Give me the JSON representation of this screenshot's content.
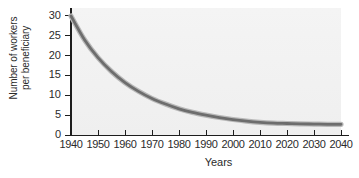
{
  "chart_data": {
    "type": "line",
    "title": "",
    "xlabel": "Years",
    "ylabel": "Number of workers per beneficiary",
    "ylabel_lines": [
      "Number of workers",
      "per beneficiary"
    ],
    "xlim": [
      1940,
      2040
    ],
    "ylim": [
      0,
      32
    ],
    "grid": false,
    "legend": "none",
    "xticks": [
      1940,
      1950,
      1960,
      1970,
      1980,
      1990,
      2000,
      2010,
      2020,
      2030,
      2040
    ],
    "xtick_labels": [
      "1940",
      "1950",
      "1960",
      "1970",
      "1980",
      "1990",
      "2000",
      "2010",
      "2020",
      "2030",
      "2040"
    ],
    "yticks": [
      0,
      5,
      10,
      15,
      20,
      25,
      30
    ],
    "ytick_labels": [
      "0",
      "5",
      "10",
      "15",
      "20",
      "25",
      "30"
    ],
    "series": [
      {
        "name": "Workers per beneficiary",
        "color": "#6d6d6d",
        "x": [
          1940,
          1945,
          1950,
          1955,
          1960,
          1965,
          1970,
          1975,
          1980,
          1985,
          1990,
          1995,
          2000,
          2005,
          2010,
          2015,
          2020,
          2025,
          2030,
          2035,
          2040
        ],
        "values": [
          30.0,
          24.0,
          19.5,
          16.0,
          13.2,
          11.0,
          9.2,
          7.8,
          6.6,
          5.7,
          5.0,
          4.4,
          3.9,
          3.5,
          3.2,
          3.0,
          2.9,
          2.8,
          2.75,
          2.7,
          2.7
        ]
      }
    ],
    "plot_background": "#f1f1f1",
    "axis_color": "#1d1d1d"
  },
  "axes": {
    "xlabel": "Years",
    "ylabel_line1": "Number of workers",
    "ylabel_line2": "per beneficiary"
  }
}
